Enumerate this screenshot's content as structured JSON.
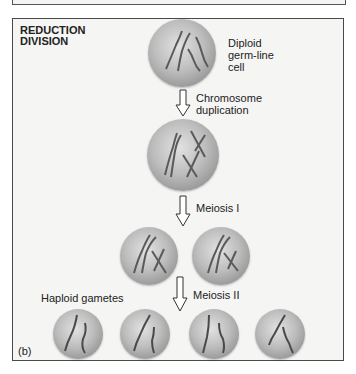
{
  "figure": {
    "title_line1": "REDUCTION",
    "title_line2": "DIVISION",
    "panel_label": "(b)",
    "stages": [
      {
        "id": "diploid",
        "label_lines": [
          "Diploid",
          "germ-line",
          "cell"
        ]
      },
      {
        "id": "duplication",
        "label_lines": [
          "Chromosome",
          "duplication"
        ]
      },
      {
        "id": "meiosis1",
        "label": "Meiosis I"
      },
      {
        "id": "meiosis2",
        "label": "Meiosis II"
      },
      {
        "id": "gametes",
        "label": "Haploid gametes"
      }
    ],
    "colors": {
      "panel_bg": "#f5f5f4",
      "border": "#4a4a4a",
      "cell_light": "#e2e2e2",
      "cell_dark": "#7a7a7a",
      "chromosome": "#5a5a5a"
    }
  }
}
